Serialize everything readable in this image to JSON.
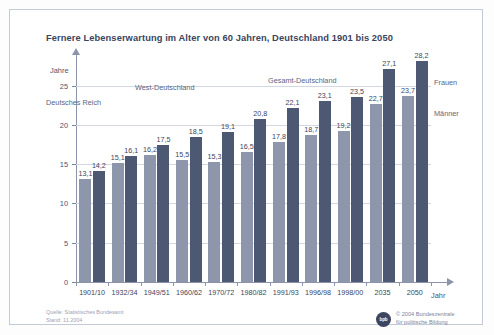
{
  "title": "Fernere Lebenserwartung im Alter von 60 Jahren, Deutschland 1901 bis 2050",
  "axis": {
    "y_label": "Jahre",
    "x_label": "Jahr"
  },
  "annotations": {
    "region_1": "Deutsches Reich",
    "region_2": "West-Deutschland",
    "region_3": "Gesamt-Deutschland"
  },
  "legend": {
    "women": "Frauen",
    "men": "Männer"
  },
  "footer": {
    "source_line_1": "Quelle: Statistisches Bundesamt",
    "source_line_2": "Stand: 11.2004",
    "credit_line_1": "© 2004 Bundeszentrale",
    "credit_line_2": "für politische Bildung",
    "logo_text": "bpb"
  },
  "chart_data": {
    "type": "bar",
    "title": "Fernere Lebenserwartung im Alter von 60 Jahren, Deutschland 1901 bis 2050",
    "xlabel": "Jahr",
    "ylabel": "Jahre",
    "ylim": [
      0,
      27
    ],
    "yticks": [
      0,
      5,
      10,
      15,
      20,
      25
    ],
    "grid": true,
    "legend_position": "right",
    "categories": [
      "1901/10",
      "1932/34",
      "1949/51",
      "1960/62",
      "1970/72",
      "1980/82",
      "1991/93",
      "1996/98",
      "1998/00",
      "2035",
      "2050"
    ],
    "series": [
      {
        "name": "Männer",
        "color": "#8d96ab",
        "values": [
          13.1,
          15.1,
          16.2,
          15.5,
          15.3,
          16.5,
          17.8,
          18.7,
          19.2,
          22.7,
          23.7
        ],
        "labels": [
          "13,1",
          "15,1",
          "16,2",
          "15,5",
          "15,3",
          "16,5",
          "17,8",
          "18,7",
          "19,2",
          "22,7",
          "23,7"
        ]
      },
      {
        "name": "Frauen",
        "color": "#4d5872",
        "values": [
          14.2,
          16.1,
          17.5,
          18.5,
          19.1,
          20.8,
          22.1,
          23.1,
          23.5,
          27.1,
          28.2
        ],
        "labels": [
          "14,2",
          "16,1",
          "17,5",
          "18,5",
          "19,1",
          "20,8",
          "22,1",
          "23,1",
          "23,5",
          "27,1",
          "28,2"
        ]
      }
    ],
    "region_annotations": [
      {
        "label": "Deutsches Reich",
        "span": [
          "1901/10",
          "1932/34"
        ]
      },
      {
        "label": "West-Deutschland",
        "span": [
          "1949/51",
          "1980/82"
        ]
      },
      {
        "label": "Gesamt-Deutschland",
        "span": [
          "1991/93",
          "2050"
        ]
      }
    ]
  }
}
